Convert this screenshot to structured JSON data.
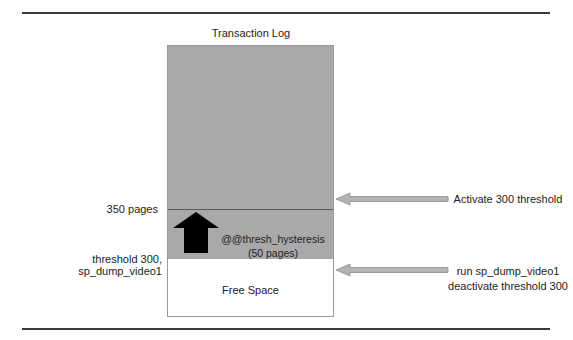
{
  "diagram": {
    "title": "Transaction Log",
    "regions": {
      "used_space_label": "",
      "hysteresis_line1": "@@thresh_hysteresis",
      "hysteresis_line2": "(50 pages)",
      "free_space": "Free Space"
    },
    "left_labels": {
      "pages_350": "350 pages",
      "threshold_300": "threshold 300, sp_dump_video1"
    },
    "right_labels": {
      "activate": "Activate 300 threshold",
      "run_line1": "run sp_dump_video1",
      "run_line2": "deactivate threshold 300"
    },
    "colors": {
      "log_fill": "#a9a9a9",
      "arrow_fill": "#b4b4b4",
      "up_arrow": "#000000",
      "rule": "#3a3a3a"
    }
  }
}
